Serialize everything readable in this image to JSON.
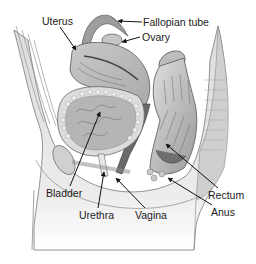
{
  "diagram": {
    "type": "anatomical-cross-section",
    "labels": [
      {
        "id": "uterus",
        "text": "Uterus",
        "x": 42,
        "y": 16
      },
      {
        "id": "fallopian-tube",
        "text": "Fallopian tube",
        "x": 143,
        "y": 17
      },
      {
        "id": "ovary",
        "text": "Ovary",
        "x": 142,
        "y": 32
      },
      {
        "id": "bladder",
        "text": "Bladder",
        "x": 46,
        "y": 188
      },
      {
        "id": "urethra",
        "text": "Urethra",
        "x": 79,
        "y": 210
      },
      {
        "id": "vagina",
        "text": "Vagina",
        "x": 135,
        "y": 210
      },
      {
        "id": "rectum",
        "text": "Rectum",
        "x": 208,
        "y": 190
      },
      {
        "id": "anus",
        "text": "Anus",
        "x": 211,
        "y": 207
      }
    ],
    "colors": {
      "background": "#ffffff",
      "tissue_light": "#e6e6e6",
      "tissue_mid": "#bdbdbd",
      "tissue_dark": "#8a8a8a",
      "outline": "#555555",
      "arrow": "#111111",
      "text": "#1a1a1a"
    }
  }
}
